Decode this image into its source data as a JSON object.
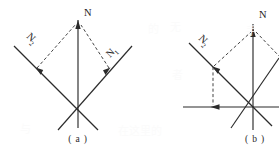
{
  "figure": {
    "kind": "vector-decomposition-diagram",
    "background_color": "#ffffff",
    "line_color": "#2b2b2b",
    "panels": [
      {
        "id": "a",
        "caption": "( a )",
        "caption_x": 78,
        "caption_y": 140,
        "origin": {
          "x": 78,
          "y": 110
        },
        "labels": {
          "resultant": "N",
          "resultant_sub": "",
          "left_component": "N",
          "left_component_sub": "2",
          "right_component": "N",
          "right_component_sub": "1"
        },
        "label_positions": {
          "resultant": {
            "x": 84,
            "y": 14
          },
          "left_component": {
            "x": 26,
            "y": 43
          },
          "right_component": {
            "x": 113,
            "y": 63
          }
        },
        "vectors": [
          {
            "name": "resultant-N",
            "from": [
              78,
              110
            ],
            "to": [
              78,
              20
            ],
            "arrow": true,
            "style": "solid"
          },
          {
            "name": "component-N2",
            "from": [
              78,
              110
            ],
            "to": [
              36,
              68
            ],
            "arrow": true,
            "style": "solid"
          },
          {
            "name": "component-N1",
            "from": [
              78,
              110
            ],
            "to": [
              110,
              68
            ],
            "arrow": true,
            "style": "solid"
          }
        ],
        "axis_lines": [
          {
            "name": "axis-vertical",
            "from": [
              78,
              20
            ],
            "to": [
              78,
              128
            ],
            "style": "solid"
          },
          {
            "name": "axis-diag-left",
            "from": [
              14,
              46
            ],
            "to": [
              98,
              130
            ],
            "style": "solid"
          },
          {
            "name": "axis-diag-right",
            "from": [
              132,
              46
            ],
            "to": [
              58,
              130
            ],
            "style": "solid"
          }
        ],
        "construction_lines": [
          {
            "name": "parallelogram-left",
            "from": [
              36,
              68
            ],
            "to": [
              78,
              22
            ],
            "style": "dashed"
          },
          {
            "name": "parallelogram-right",
            "from": [
              110,
              68
            ],
            "to": [
              78,
              22
            ],
            "style": "dashed"
          }
        ]
      },
      {
        "id": "b",
        "caption": "( b )",
        "caption_x": 255,
        "caption_y": 140,
        "origin": {
          "x": 253,
          "y": 107
        },
        "labels": {
          "resultant": "N",
          "left_component": "N",
          "left_component_sub": "2"
        },
        "label_positions": {
          "resultant": {
            "x": 258,
            "y": 16
          },
          "left_component": {
            "x": 198,
            "y": 45
          }
        },
        "vectors": [
          {
            "name": "resultant-N",
            "from": [
              253,
              107
            ],
            "to": [
              253,
              28
            ],
            "arrow": true,
            "style": "solid"
          },
          {
            "name": "component-N2",
            "from": [
              253,
              107
            ],
            "to": [
              213,
              67
            ],
            "arrow": true,
            "style": "solid"
          },
          {
            "name": "horizontal-component",
            "from": [
              253,
              107
            ],
            "to": [
              211,
              107
            ],
            "arrow": true,
            "style": "solid"
          }
        ],
        "axis_lines": [
          {
            "name": "axis-vertical",
            "from": [
              253,
              24
            ],
            "to": [
              253,
              130
            ],
            "style": "solid"
          },
          {
            "name": "axis-horizontal",
            "from": [
              183,
              107
            ],
            "to": [
              279,
              107
            ],
            "style": "solid"
          },
          {
            "name": "axis-diag-left",
            "from": [
              189,
              43
            ],
            "to": [
              270,
              124
            ],
            "style": "solid"
          },
          {
            "name": "axis-diag-right",
            "from": [
              279,
              60
            ],
            "to": [
              232,
              128
            ],
            "style": "solid"
          }
        ],
        "construction_lines": [
          {
            "name": "parallelogram-left",
            "from": [
              213,
              67
            ],
            "to": [
              253,
              30
            ],
            "style": "dashed"
          },
          {
            "name": "parallelogram-right",
            "from": [
              253,
              30
            ],
            "to": [
              279,
              58
            ],
            "style": "dashed"
          },
          {
            "name": "drop-vertical",
            "from": [
              213,
              67
            ],
            "to": [
              213,
              107
            ],
            "style": "dashed"
          }
        ]
      }
    ]
  },
  "artifacts": {
    "show_through_marks": [
      {
        "text": "的",
        "x": 148,
        "y": 28
      },
      {
        "text": "无",
        "x": 170,
        "y": 26
      },
      {
        "text": "手",
        "x": 246,
        "y": 30
      },
      {
        "text": "者",
        "x": 172,
        "y": 74
      },
      {
        "text": "在这里的",
        "x": 118,
        "y": 130
      },
      {
        "text": "与",
        "x": 20,
        "y": 128
      }
    ]
  }
}
